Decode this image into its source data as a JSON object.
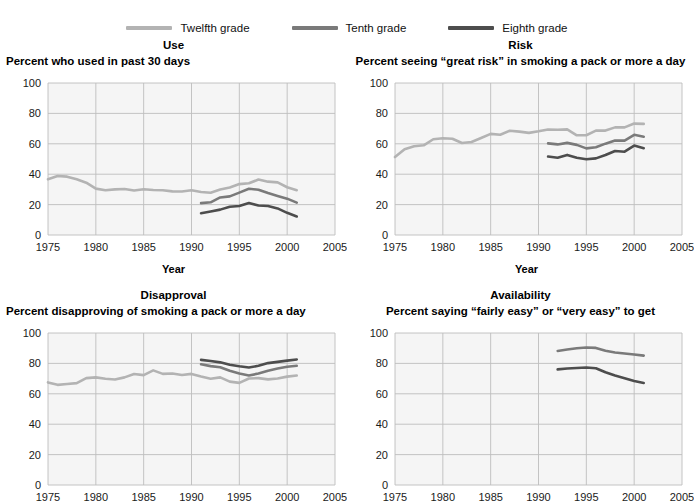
{
  "legend": {
    "items": [
      {
        "label": "Twelfth grade",
        "color": "#b3b3b3",
        "key": "twelfth"
      },
      {
        "label": "Tenth grade",
        "color": "#7a7a7a",
        "key": "tenth"
      },
      {
        "label": "Eighth grade",
        "color": "#4d4d4d",
        "key": "eighth"
      }
    ]
  },
  "axis": {
    "x_label": "Year",
    "x_ticks": [
      "1975",
      "1980",
      "1985",
      "1990",
      "1995",
      "2000",
      "2005"
    ],
    "y_ticks": [
      "0",
      "20",
      "40",
      "60",
      "80",
      "100"
    ]
  },
  "chart_data": [
    {
      "id": "use",
      "type": "line",
      "title": "Use",
      "subtitle": "Percent who used in past 30 days",
      "xlabel": "Year",
      "ylabel": "",
      "xlim": [
        1975,
        2005
      ],
      "ylim": [
        0,
        100
      ],
      "xticks": [
        1975,
        1980,
        1985,
        1990,
        1995,
        2000,
        2005
      ],
      "yticks": [
        0,
        20,
        40,
        60,
        80,
        100
      ],
      "grid": true,
      "legend_position": "top-center-shared",
      "series": [
        {
          "name": "Twelfth grade",
          "color": "#b3b3b3",
          "x": [
            1975,
            1976,
            1977,
            1978,
            1979,
            1980,
            1981,
            1982,
            1983,
            1984,
            1985,
            1986,
            1987,
            1988,
            1989,
            1990,
            1991,
            1992,
            1993,
            1994,
            1995,
            1996,
            1997,
            1998,
            1999,
            2000,
            2001
          ],
          "values": [
            36.7,
            38.8,
            38.4,
            36.7,
            34.4,
            30.5,
            29.4,
            30.0,
            30.3,
            29.3,
            30.1,
            29.6,
            29.4,
            28.7,
            28.6,
            29.4,
            28.3,
            27.8,
            29.9,
            31.2,
            33.5,
            34.0,
            36.5,
            35.1,
            34.6,
            31.4,
            29.5
          ]
        },
        {
          "name": "Tenth grade",
          "color": "#7a7a7a",
          "x": [
            1991,
            1992,
            1993,
            1994,
            1995,
            1996,
            1997,
            1998,
            1999,
            2000,
            2001
          ],
          "values": [
            21.0,
            21.5,
            24.7,
            25.4,
            27.9,
            30.4,
            29.8,
            27.6,
            25.7,
            23.9,
            21.3
          ]
        },
        {
          "name": "Eighth grade",
          "color": "#4d4d4d",
          "x": [
            1991,
            1992,
            1993,
            1994,
            1995,
            1996,
            1997,
            1998,
            1999,
            2000,
            2001
          ],
          "values": [
            14.3,
            15.5,
            16.7,
            18.6,
            19.1,
            21.0,
            19.4,
            19.1,
            17.5,
            14.6,
            12.2
          ]
        }
      ]
    },
    {
      "id": "risk",
      "type": "line",
      "title": "Risk",
      "subtitle": "Percent seeing “great risk” in smoking a pack or more a day",
      "xlabel": "Year",
      "ylabel": "",
      "xlim": [
        1975,
        2005
      ],
      "ylim": [
        0,
        100
      ],
      "xticks": [
        1975,
        1980,
        1985,
        1990,
        1995,
        2000,
        2005
      ],
      "yticks": [
        0,
        20,
        40,
        60,
        80,
        100
      ],
      "grid": true,
      "legend_position": "top-center-shared",
      "series": [
        {
          "name": "Twelfth grade",
          "color": "#b3b3b3",
          "x": [
            1975,
            1976,
            1977,
            1978,
            1979,
            1980,
            1981,
            1982,
            1983,
            1984,
            1985,
            1986,
            1987,
            1988,
            1989,
            1990,
            1991,
            1992,
            1993,
            1994,
            1995,
            1996,
            1997,
            1998,
            1999,
            2000,
            2001
          ],
          "values": [
            51.3,
            56.4,
            58.4,
            59.0,
            63.0,
            63.7,
            63.3,
            60.5,
            61.2,
            63.8,
            66.5,
            66.0,
            68.6,
            68.0,
            67.2,
            68.2,
            69.4,
            69.2,
            69.5,
            65.6,
            65.6,
            68.7,
            68.7,
            70.8,
            70.8,
            73.3,
            73.1
          ]
        },
        {
          "name": "Tenth grade",
          "color": "#7a7a7a",
          "x": [
            1991,
            1992,
            1993,
            1994,
            1995,
            1996,
            1997,
            1998,
            1999,
            2000,
            2001
          ],
          "values": [
            60.3,
            59.6,
            60.6,
            59.3,
            57.0,
            57.7,
            60.1,
            62.2,
            62.1,
            65.9,
            64.7
          ]
        },
        {
          "name": "Eighth grade",
          "color": "#4d4d4d",
          "x": [
            1991,
            1992,
            1993,
            1994,
            1995,
            1996,
            1997,
            1998,
            1999,
            2000,
            2001
          ],
          "values": [
            51.6,
            50.8,
            52.7,
            50.8,
            49.8,
            50.4,
            52.6,
            55.3,
            54.8,
            58.8,
            57.1
          ]
        }
      ]
    },
    {
      "id": "disapproval",
      "type": "line",
      "title": "Disapproval",
      "subtitle": "Percent disapproving of smoking a pack or more a day",
      "xlabel": "",
      "ylabel": "",
      "xlim": [
        1975,
        2005
      ],
      "ylim": [
        0,
        100
      ],
      "xticks": [
        1975,
        1980,
        1985,
        1990,
        1995,
        2000,
        2005
      ],
      "yticks": [
        0,
        20,
        40,
        60,
        80,
        100
      ],
      "grid": true,
      "legend_position": "top-center-shared",
      "series": [
        {
          "name": "Twelfth grade",
          "color": "#b3b3b3",
          "x": [
            1975,
            1976,
            1977,
            1978,
            1979,
            1980,
            1981,
            1982,
            1983,
            1984,
            1985,
            1986,
            1987,
            1988,
            1989,
            1990,
            1991,
            1992,
            1993,
            1994,
            1995,
            1996,
            1997,
            1998,
            1999,
            2000,
            2001
          ],
          "values": [
            67.5,
            65.9,
            66.4,
            67.0,
            70.3,
            70.8,
            69.9,
            69.4,
            70.8,
            73.0,
            72.3,
            75.4,
            73.1,
            73.4,
            72.4,
            73.1,
            71.4,
            69.9,
            70.8,
            68.0,
            67.2,
            70.1,
            70.3,
            69.5,
            70.1,
            71.3,
            72.0
          ]
        },
        {
          "name": "Tenth grade",
          "color": "#7a7a7a",
          "x": [
            1991,
            1992,
            1993,
            1994,
            1995,
            1996,
            1997,
            1998,
            1999,
            2000,
            2001
          ],
          "values": [
            79.4,
            78.2,
            77.5,
            75.2,
            73.4,
            72.1,
            73.3,
            75.2,
            76.6,
            77.8,
            78.4
          ]
        },
        {
          "name": "Eighth grade",
          "color": "#4d4d4d",
          "x": [
            1991,
            1992,
            1993,
            1994,
            1995,
            1996,
            1997,
            1998,
            1999,
            2000,
            2001
          ],
          "values": [
            82.3,
            81.6,
            80.7,
            79.1,
            78.1,
            77.3,
            78.4,
            80.2,
            81.0,
            81.8,
            82.6
          ]
        }
      ]
    },
    {
      "id": "availability",
      "type": "line",
      "title": "Availability",
      "subtitle": "Percent saying “fairly easy” or “very easy” to get",
      "xlabel": "",
      "ylabel": "",
      "xlim": [
        1975,
        2005
      ],
      "ylim": [
        0,
        100
      ],
      "xticks": [
        1975,
        1980,
        1985,
        1990,
        1995,
        2000,
        2005
      ],
      "yticks": [
        0,
        20,
        40,
        60,
        80,
        100
      ],
      "grid": true,
      "legend_position": "top-center-shared",
      "series": [
        {
          "name": "Tenth grade",
          "color": "#7a7a7a",
          "x": [
            1992,
            1993,
            1994,
            1995,
            1996,
            1997,
            1998,
            1999,
            2000,
            2001
          ],
          "values": [
            88.2,
            89.1,
            90.0,
            90.5,
            90.2,
            88.3,
            87.2,
            86.5,
            85.8,
            85.1
          ]
        },
        {
          "name": "Eighth grade",
          "color": "#4d4d4d",
          "x": [
            1992,
            1993,
            1994,
            1995,
            1996,
            1997,
            1998,
            1999,
            2000,
            2001
          ],
          "values": [
            76.1,
            76.6,
            77.0,
            77.3,
            76.8,
            74.2,
            72.0,
            70.3,
            68.4,
            67.1
          ]
        }
      ]
    }
  ]
}
